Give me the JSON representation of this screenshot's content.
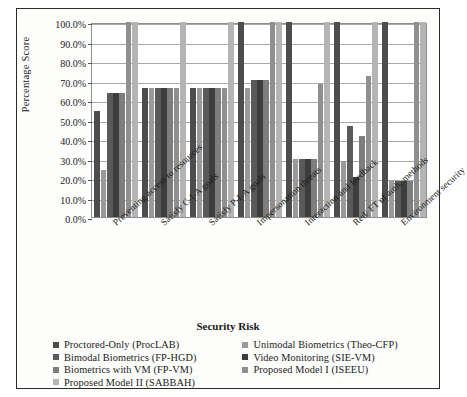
{
  "figure": {
    "y_axis_title": "Percentage Score",
    "x_axis_title": "Security Risk"
  },
  "chart_data": {
    "type": "bar",
    "title": "",
    "xlabel": "Security Risk",
    "ylabel": "Percentage Score",
    "ylim": [
      0,
      100
    ],
    "grid": true,
    "legend_position": "bottom",
    "y_tick_labels": [
      "100.0%",
      "90.0%",
      "80.0%",
      "70.0%",
      "60.0%",
      "50.0%",
      "40.0%",
      "30.0%",
      "20.0%",
      "10.0%",
      "0.0%"
    ],
    "y_ticks": [
      100,
      90,
      80,
      70,
      60,
      50,
      40,
      30,
      20,
      10,
      0
    ],
    "categories": [
      "Preventing access to resources",
      "Satisfy C-I-A goals",
      "Satisfy P-I-A goals",
      "Impersonation threats",
      "Interaction and feedback",
      "Red/ FT of auth. methods",
      "Environment security"
    ],
    "series": [
      {
        "name": "Proctored-Only (ProcLAB)",
        "color": "#4d4d4d",
        "values": [
          54.5,
          66.0,
          66.0,
          100.0,
          100.0,
          100.0,
          100.0
        ]
      },
      {
        "name": "Unimodal Biometrics (Theo-CFP)",
        "color": "#9a9a9a",
        "values": [
          24.0,
          66.0,
          66.0,
          66.0,
          29.5,
          28.8,
          18.5
        ]
      },
      {
        "name": "Bimodal Biometrics (FP-HGD)",
        "color": "#5a5a5a",
        "values": [
          63.5,
          66.0,
          66.0,
          70.5,
          29.5,
          46.5,
          18.5
        ]
      },
      {
        "name": "Video Monitoring (SIE-VM)",
        "color": "#3d3d3d",
        "values": [
          63.5,
          66.0,
          66.0,
          70.5,
          29.5,
          20.5,
          18.5
        ]
      },
      {
        "name": "Biometrics with VM (FP-VM)",
        "color": "#7d7d7d",
        "values": [
          63.5,
          66.0,
          66.0,
          70.5,
          29.5,
          41.8,
          18.5
        ]
      },
      {
        "name": "Proposed Model I (ISEEU)",
        "color": "#8f8f8f",
        "values": [
          100.0,
          66.0,
          66.0,
          100.0,
          68.0,
          72.3,
          100.0
        ]
      },
      {
        "name": "Proposed Model II (SABBAH)",
        "color": "#b4b4b4",
        "values": [
          100.0,
          100.0,
          100.0,
          100.0,
          100.0,
          100.0,
          100.0
        ]
      }
    ]
  },
  "legend": {
    "left_column": [
      "Proctored-Only (ProcLAB)",
      "Bimodal Biometrics (FP-HGD)",
      "Biometrics with VM (FP-VM)",
      "Proposed Model II (SABBAH)"
    ],
    "right_column": [
      "Unimodal Biometrics (Theo-CFP)",
      "Video Monitoring (SIE-VM)",
      "Proposed Model I (ISEEU)"
    ],
    "left_colors": [
      "#4d4d4d",
      "#5a5a5a",
      "#7d7d7d",
      "#b4b4b4"
    ],
    "right_colors": [
      "#9a9a9a",
      "#3d3d3d",
      "#8f8f8f"
    ]
  }
}
